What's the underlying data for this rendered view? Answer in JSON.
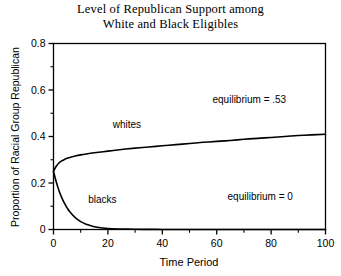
{
  "chart_data": {
    "type": "line",
    "title": "Level of Republican Support among\nWhite and Black Eligibles",
    "title_line1": "Level of Republican Support among",
    "title_line2": "White and Black Eligibles",
    "xlabel": "Time Period",
    "ylabel": "Proportion of Racial Group Republican",
    "xlim": [
      0,
      100
    ],
    "ylim": [
      0,
      0.8
    ],
    "xticks": [
      0,
      20,
      40,
      60,
      80,
      100
    ],
    "xticklabels": [
      "0",
      "20",
      "40",
      "60",
      "80",
      "100"
    ],
    "xminorticks": [
      10,
      30,
      50,
      70,
      90
    ],
    "yticks": [
      0,
      0.2,
      0.4,
      0.6,
      0.8
    ],
    "yticklabels": [
      "0",
      "0.2",
      "0.4",
      "0.6",
      "0.8"
    ],
    "yminorticks": [
      0.1,
      0.3,
      0.5,
      0.7
    ],
    "grid": false,
    "legend_position": "inline-annotations",
    "line_color": "#000000",
    "frame_color": "#000000",
    "x": [
      0,
      1,
      2,
      3,
      4,
      5,
      6,
      8,
      10,
      12,
      15,
      20,
      25,
      30,
      35,
      40,
      45,
      50,
      55,
      60,
      65,
      70,
      75,
      80,
      85,
      90,
      95,
      100
    ],
    "series": [
      {
        "name": "whites",
        "label": "whites",
        "equilibrium": 0.53,
        "equilibrium_label": "equilibrium = .53",
        "values": [
          0.25,
          0.272,
          0.286,
          0.295,
          0.301,
          0.306,
          0.31,
          0.316,
          0.321,
          0.325,
          0.33,
          0.337,
          0.344,
          0.35,
          0.355,
          0.36,
          0.365,
          0.37,
          0.375,
          0.379,
          0.383,
          0.388,
          0.392,
          0.396,
          0.4,
          0.404,
          0.407,
          0.41
        ]
      },
      {
        "name": "blacks",
        "label": "blacks",
        "equilibrium": 0,
        "equilibrium_label": "equilibrium = 0",
        "values": [
          0.25,
          0.205,
          0.168,
          0.138,
          0.113,
          0.093,
          0.076,
          0.051,
          0.034,
          0.023,
          0.012,
          0.004,
          0.002,
          0.001,
          0.0005,
          0.0003,
          0.0002,
          0.0001,
          0.0001,
          0.0,
          0.0,
          0.0,
          0.0,
          0.0,
          0.0,
          0.0,
          0.0,
          0.0
        ]
      }
    ],
    "annotations": [
      {
        "name": "whites-curve-label",
        "text": "whites",
        "x": 27,
        "y": 0.435
      },
      {
        "name": "blacks-curve-label",
        "text": "blacks",
        "x": 18,
        "y": 0.115
      },
      {
        "name": "whites-equilibrium-label",
        "text": "equilibrium = .53",
        "x": 72,
        "y": 0.545
      },
      {
        "name": "blacks-equilibrium-label",
        "text": "equilibrium = 0",
        "x": 76,
        "y": 0.125
      }
    ]
  }
}
